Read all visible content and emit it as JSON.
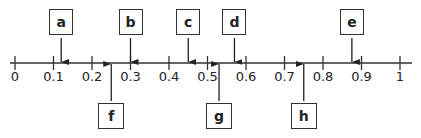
{
  "number_line": {
    "min": 0,
    "max": 1,
    "ticks": [
      "0",
      "0.1",
      "0.2",
      "0.3",
      "0.4",
      "0.5",
      "0.6",
      "0.7",
      "0.8",
      "0.9",
      "1"
    ]
  },
  "markers": {
    "above": [
      {
        "label": "a",
        "value": 0.12
      },
      {
        "label": "b",
        "value": 0.3
      },
      {
        "label": "c",
        "value": 0.45
      },
      {
        "label": "d",
        "value": 0.57
      },
      {
        "label": "e",
        "value": 0.875
      }
    ],
    "below": [
      {
        "label": "f",
        "value": 0.25
      },
      {
        "label": "g",
        "value": 0.53
      },
      {
        "label": "h",
        "value": 0.75
      }
    ]
  },
  "colors": {
    "line": "#333333",
    "text": "#222222"
  }
}
